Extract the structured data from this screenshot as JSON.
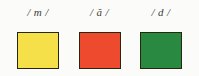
{
  "card": {
    "background_color": "#fbfbf9",
    "label_color": "#3c3c3c",
    "swatch_border_color": "#262611"
  },
  "columns": [
    {
      "label": "/ m /",
      "phoneme": "m",
      "swatch_color": "#f5e04a",
      "swatch_color_name": "yellow"
    },
    {
      "label": "/ ă /",
      "phoneme": "ă",
      "swatch_color": "#ee4a2e",
      "swatch_color_name": "red"
    },
    {
      "label": "/ d /",
      "phoneme": "d",
      "swatch_color": "#2a8940",
      "swatch_color_name": "green"
    }
  ]
}
